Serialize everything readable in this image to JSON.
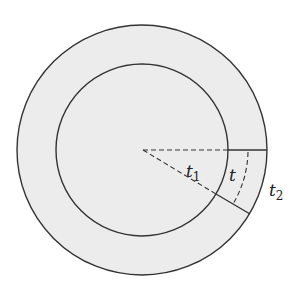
{
  "diagram": {
    "colors": {
      "fill": "#ececec",
      "stroke": "#333333",
      "background": "#ffffff"
    },
    "labels": {
      "t1": {
        "base": "t",
        "sub": "1"
      },
      "t": {
        "base": "t"
      },
      "t2": {
        "base": "t",
        "sub": "2"
      }
    }
  }
}
